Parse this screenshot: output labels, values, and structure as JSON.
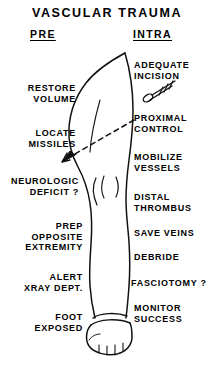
{
  "title": "VASCULAR TRAUMA",
  "columns": {
    "left": {
      "heading": "PRE"
    },
    "right": {
      "heading": "INTRA"
    }
  },
  "pre_items": [
    {
      "text": "RESTORE\nVOLUME",
      "right_px": 76,
      "top_px": 83
    },
    {
      "text": "LOCATE\nMISSILES",
      "right_px": 76,
      "top_px": 128
    },
    {
      "text": "NEUROLOGIC\nDEFICIT ?",
      "right_px": 79,
      "top_px": 176
    },
    {
      "text": "PREP\nOPPOSITE\nEXTREMITY",
      "right_px": 83,
      "top_px": 221
    },
    {
      "text": "ALERT\nXRAY DEPT.",
      "right_px": 83,
      "top_px": 272
    },
    {
      "text": "FOOT\nEXPOSED",
      "right_px": 83,
      "top_px": 312
    }
  ],
  "intra_items": [
    {
      "text": "ADEQUATE\nINCISION",
      "left_px": 134,
      "top_px": 60
    },
    {
      "text": "PROXIMAL\nCONTROL",
      "left_px": 134,
      "top_px": 113
    },
    {
      "text": "MOBILIZE\nVESSELS",
      "left_px": 134,
      "top_px": 152
    },
    {
      "text": "DISTAL\nTHROMBUS",
      "left_px": 134,
      "top_px": 192
    },
    {
      "text": "SAVE VEINS",
      "left_px": 134,
      "top_px": 228
    },
    {
      "text": "DEBRIDE",
      "left_px": 134,
      "top_px": 252
    },
    {
      "text": "FASCIOTOMY ?",
      "left_px": 131,
      "top_px": 278
    },
    {
      "text": "MONITOR\nSUCCESS",
      "left_px": 134,
      "top_px": 303
    }
  ],
  "graphics": {
    "scalpel_icon": "scalpel-icon",
    "arrow_icon": "dashed-arrow-icon",
    "leg_icon": "leg-outline-illustration",
    "foot_icon": "wrapped-foot-icon",
    "knee_icon": "knee-contour-marks"
  },
  "colors": {
    "ink": "#000000",
    "background": "#ffffff"
  }
}
